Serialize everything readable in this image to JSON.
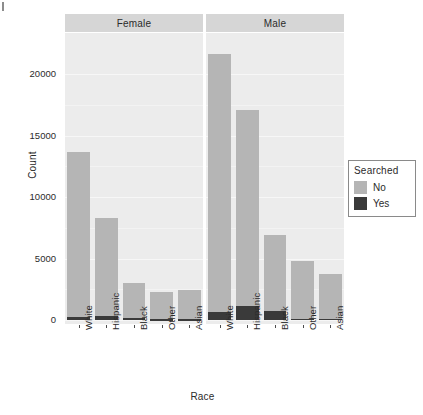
{
  "chart_data": {
    "type": "bar",
    "subtype": "stacked-bar-faceted",
    "title": "",
    "xlabel": "Race",
    "ylabel": "Count",
    "categories": [
      "White",
      "Hispanic",
      "Black",
      "Other",
      "Asian"
    ],
    "facets": [
      "Female",
      "Male"
    ],
    "facet_variable": "Gender",
    "legend": {
      "title": "Searched",
      "position": "right",
      "entries": [
        {
          "label": "No",
          "color": "#b5b5b5"
        },
        {
          "label": "Yes",
          "color": "#3a3a3a"
        }
      ]
    },
    "ylim": [
      0,
      22600
    ],
    "yticks": [
      0,
      5000,
      10000,
      15000,
      20000
    ],
    "ytick_labels": [
      "0",
      "5000",
      "10000",
      "15000",
      "20000"
    ],
    "grid": true,
    "panels": [
      {
        "facet": "Female",
        "series": [
          {
            "name": "No",
            "values": [
              13400,
              7950,
              2850,
              2200,
              2400
            ]
          },
          {
            "name": "Yes",
            "values": [
              250,
              330,
              150,
              60,
              60
            ]
          }
        ],
        "totals": [
          13650,
          8280,
          3000,
          2260,
          2460
        ]
      },
      {
        "facet": "Male",
        "series": [
          {
            "name": "No",
            "values": [
              21000,
              15900,
              6150,
              4700,
              3680
            ]
          },
          {
            "name": "Yes",
            "values": [
              650,
              1150,
              730,
              120,
              100
            ]
          }
        ],
        "totals": [
          21650,
          17050,
          6880,
          4820,
          3780
        ]
      }
    ]
  },
  "axis": {
    "y_title": "Count",
    "x_title": "Race"
  }
}
